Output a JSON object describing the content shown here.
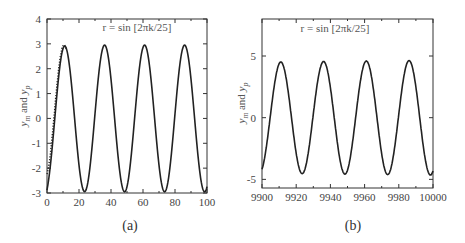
{
  "chart_data": [
    {
      "type": "line",
      "panel_label": "(a)",
      "title": "r = sin [2πk/25]",
      "xlabel": "",
      "ylabel": "y_m and y_p",
      "xlim": [
        0,
        100
      ],
      "ylim": [
        -3,
        4
      ],
      "xticks": [
        0,
        20,
        40,
        60,
        80,
        100
      ],
      "yticks": [
        -3,
        -2,
        -1,
        0,
        1,
        2,
        3,
        4
      ],
      "grid": false,
      "legend": null,
      "series": [
        {
          "name": "y_m",
          "style": "solid",
          "description": "sinusoid period 25, amplitude ~2.95, starts near -1.9 at k=0, peaks ~3.05 at k≈11",
          "x": [
            0,
            2,
            5,
            8,
            11,
            14,
            18,
            22,
            25,
            28,
            32,
            36,
            39,
            43,
            47,
            50,
            53,
            57,
            61,
            64,
            68,
            72,
            75,
            78,
            82,
            86,
            89,
            93,
            97,
            100
          ],
          "values": [
            -1.9,
            -1.6,
            0.5,
            2.3,
            3.05,
            2.5,
            0.0,
            -2.2,
            -2.9,
            -2.3,
            0.3,
            2.9,
            2.1,
            -0.6,
            -2.6,
            -2.9,
            -2.2,
            0.5,
            2.95,
            2.1,
            -0.5,
            -2.6,
            -2.85,
            -2.2,
            0.4,
            2.95,
            2.1,
            -0.5,
            -2.6,
            -2.85
          ]
        },
        {
          "name": "y_p",
          "style": "dotted",
          "description": "closely tracks y_m; small deviation during first ~8 samples (transient)",
          "x": [
            0,
            2,
            5,
            8,
            11
          ],
          "values": [
            -1.5,
            -1.0,
            0.8,
            2.5,
            3.1
          ]
        }
      ]
    },
    {
      "type": "line",
      "panel_label": "(b)",
      "title": "r = sin [2πk/25]",
      "xlabel": "",
      "ylabel": "y_m and y_p",
      "xlim": [
        9900,
        10000
      ],
      "ylim": [
        -5.7,
        8
      ],
      "xticks": [
        9900,
        9920,
        9940,
        9960,
        9980,
        10000
      ],
      "yticks": [
        -5,
        0,
        5
      ],
      "grid": false,
      "legend": null,
      "series": [
        {
          "name": "y_m",
          "style": "solid",
          "description": "steady-state sinusoid period 25, amplitude ~4.55; peaks at k≈9911, 9936, 9961, 9986; troughs at k≈9924, 9949, 9974",
          "x": [
            9900,
            9905,
            9911,
            9917,
            9924,
            9930,
            9936,
            9942,
            9949,
            9955,
            9961,
            9967,
            9974,
            9980,
            9986,
            9992,
            10000
          ],
          "values": [
            -4.3,
            0.5,
            4.55,
            0.0,
            -4.5,
            0.0,
            4.55,
            0.0,
            -4.5,
            0.0,
            4.6,
            0.0,
            -4.4,
            0.0,
            4.65,
            0.0,
            -4.2
          ]
        },
        {
          "name": "y_p",
          "style": "dotted",
          "description": "indistinguishable from y_m in steady state"
        }
      ]
    }
  ],
  "panels": {
    "a": {
      "label": "(a)",
      "title": "r = sin [2πk/25]",
      "ylabel_m": "y",
      "ylabel_m_sub": "m",
      "ylabel_and": "and",
      "ylabel_p": "y",
      "ylabel_p_sub": "p"
    },
    "b": {
      "label": "(b)",
      "title": "r = sin [2πk/25]",
      "ylabel_m": "y",
      "ylabel_m_sub": "m",
      "ylabel_and": "and",
      "ylabel_p": "y",
      "ylabel_p_sub": "p"
    }
  },
  "colors": {
    "line": "#222222",
    "axis": "#333333",
    "text": "#444444"
  }
}
